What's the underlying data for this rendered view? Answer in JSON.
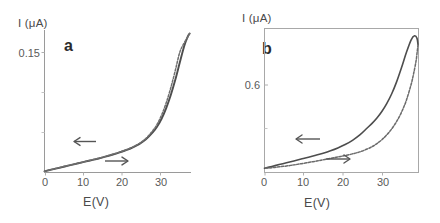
{
  "figure": {
    "background": "#ffffff",
    "line_color": "#4d4d4d",
    "axis_color": "#8c8c8c",
    "text_color": "#4a4a4a"
  },
  "panels": [
    {
      "letter": "a",
      "ylabel": "I (μA)",
      "xlabel": "E(V)",
      "ytick_labels": [
        "0.15"
      ],
      "xtick_labels": [
        "0",
        "10",
        "20",
        "30"
      ],
      "frame": "left-bottom",
      "arrow_back": "←",
      "arrow_forward": "→"
    },
    {
      "letter": "b",
      "ylabel": "I (μA)",
      "xlabel": "E(V)",
      "ytick_labels": [
        "0.6"
      ],
      "xtick_labels": [
        "0",
        "10",
        "20",
        "30"
      ],
      "frame": "box",
      "arrow_back": "←",
      "arrow_forward": "→"
    }
  ],
  "chart_data": [
    {
      "type": "line",
      "title": "a",
      "xlabel": "E(V)",
      "ylabel": "I (μA)",
      "xlim": [
        0,
        32.5
      ],
      "ylim": [
        0,
        0.178
      ],
      "xticks": [
        0,
        10,
        20,
        30
      ],
      "yticks": [
        0.15
      ],
      "grid": false,
      "legend": "none",
      "annotations": [
        {
          "text": "←",
          "x": 9.5,
          "y": 0.031,
          "meaning": "reverse sweep direction"
        },
        {
          "text": "→",
          "x": 16.5,
          "y": 0.012,
          "meaning": "forward sweep direction"
        }
      ],
      "series": [
        {
          "name": "forward sweep",
          "x": [
            0.0,
            1.5,
            3.0,
            4.5,
            6.0,
            7.5,
            9.0,
            10.5,
            12.0,
            13.5,
            15.0,
            16.5,
            18.0,
            19.5,
            21.0,
            22.5,
            24.0,
            25.0,
            26.0,
            27.0,
            28.0,
            29.0,
            30.0,
            31.0,
            31.8,
            32.2
          ],
          "y": [
            0.0015,
            0.0035,
            0.0055,
            0.0075,
            0.0095,
            0.0115,
            0.0135,
            0.0155,
            0.0175,
            0.0198,
            0.0222,
            0.0248,
            0.0278,
            0.0312,
            0.0355,
            0.0415,
            0.05,
            0.0575,
            0.0675,
            0.0805,
            0.0965,
            0.1155,
            0.137,
            0.158,
            0.17,
            0.1735
          ]
        },
        {
          "name": "reverse sweep",
          "x": [
            32.2,
            31.8,
            31.0,
            30.0,
            29.0,
            28.0,
            27.0,
            26.0,
            25.0,
            24.0,
            22.5,
            21.0,
            19.5,
            18.0,
            16.5,
            15.0,
            13.5,
            12.0,
            10.5,
            9.0,
            7.5,
            6.0,
            4.5,
            3.0,
            1.5,
            0.0
          ],
          "y": [
            0.1735,
            0.1695,
            0.162,
            0.15,
            0.127,
            0.1055,
            0.087,
            0.072,
            0.0605,
            0.052,
            0.0425,
            0.0362,
            0.0316,
            0.0281,
            0.0251,
            0.0225,
            0.02,
            0.0177,
            0.0157,
            0.0137,
            0.0117,
            0.0097,
            0.0077,
            0.0057,
            0.0037,
            0.0016
          ]
        }
      ]
    },
    {
      "type": "line",
      "title": "b",
      "xlabel": "E(V)",
      "ylabel": "I (μA)",
      "xlim": [
        0,
        31.5
      ],
      "ylim": [
        0,
        1.02
      ],
      "xticks": [
        0,
        10,
        20,
        30
      ],
      "yticks": [
        0.6
      ],
      "grid": false,
      "legend": "none",
      "annotations": [
        {
          "text": "←",
          "x": 10.5,
          "y": 0.175,
          "meaning": "reverse sweep direction"
        },
        {
          "text": "→",
          "x": 17.0,
          "y": 0.075,
          "meaning": "forward sweep direction"
        }
      ],
      "series": [
        {
          "name": "forward sweep",
          "x": [
            0.0,
            1.5,
            3.0,
            4.5,
            6.0,
            7.5,
            9.0,
            10.5,
            12.0,
            13.5,
            15.0,
            16.5,
            18.0,
            19.5,
            21.0,
            22.0,
            23.0,
            24.0,
            25.0,
            26.0,
            27.0,
            28.0,
            29.0,
            30.0,
            30.7,
            31.2,
            31.4
          ],
          "y": [
            0.03,
            0.043,
            0.056,
            0.069,
            0.082,
            0.095,
            0.108,
            0.122,
            0.137,
            0.154,
            0.174,
            0.198,
            0.228,
            0.266,
            0.315,
            0.348,
            0.386,
            0.432,
            0.488,
            0.556,
            0.64,
            0.74,
            0.848,
            0.94,
            0.968,
            0.95,
            0.905
          ]
        },
        {
          "name": "reverse sweep",
          "x": [
            31.4,
            31.2,
            31.0,
            30.5,
            30.0,
            29.0,
            28.0,
            27.0,
            26.0,
            25.0,
            24.0,
            23.0,
            22.0,
            21.0,
            19.5,
            18.0,
            16.5,
            15.0,
            13.5,
            12.0,
            10.5,
            9.0,
            7.5,
            6.0,
            4.5,
            3.0,
            1.5,
            0.0
          ],
          "y": [
            0.905,
            0.845,
            0.79,
            0.7,
            0.625,
            0.51,
            0.425,
            0.36,
            0.308,
            0.266,
            0.232,
            0.205,
            0.183,
            0.166,
            0.146,
            0.132,
            0.12,
            0.11,
            0.1,
            0.09,
            0.08,
            0.071,
            0.062,
            0.054,
            0.046,
            0.04,
            0.034,
            0.029
          ]
        }
      ]
    }
  ]
}
